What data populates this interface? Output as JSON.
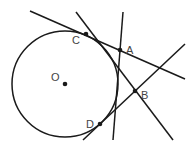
{
  "diagram": {
    "type": "geometry",
    "colors": {
      "stroke": "#1a1a1a",
      "label": "#444444",
      "background": "#ffffff"
    },
    "circle": {
      "center_label": "O",
      "cx": 65,
      "cy": 84,
      "r": 53
    },
    "points": [
      {
        "id": "O",
        "label": "O",
        "x": 65,
        "y": 84,
        "lx": 51,
        "ly": 81
      },
      {
        "id": "C",
        "label": "C",
        "x": 86,
        "y": 34,
        "lx": 72,
        "ly": 44
      },
      {
        "id": "A",
        "label": "A",
        "x": 120,
        "y": 50,
        "lx": 126,
        "ly": 54
      },
      {
        "id": "B",
        "label": "B",
        "x": 135,
        "y": 91,
        "lx": 141,
        "ly": 99
      },
      {
        "id": "D",
        "label": "D",
        "x": 100,
        "y": 124,
        "lx": 86,
        "ly": 128
      }
    ],
    "lines": [
      {
        "id": "line-CA",
        "x1": 30,
        "y1": 11,
        "x2": 185,
        "y2": 79
      },
      {
        "id": "line-through-B-tangent",
        "x1": 76,
        "y1": 12,
        "x2": 173,
        "y2": 140
      },
      {
        "id": "line-vertical-through-A",
        "x1": 123,
        "y1": 12,
        "x2": 113,
        "y2": 140
      },
      {
        "id": "line-DB",
        "x1": 83,
        "y1": 140,
        "x2": 185,
        "y2": 44
      }
    ]
  }
}
